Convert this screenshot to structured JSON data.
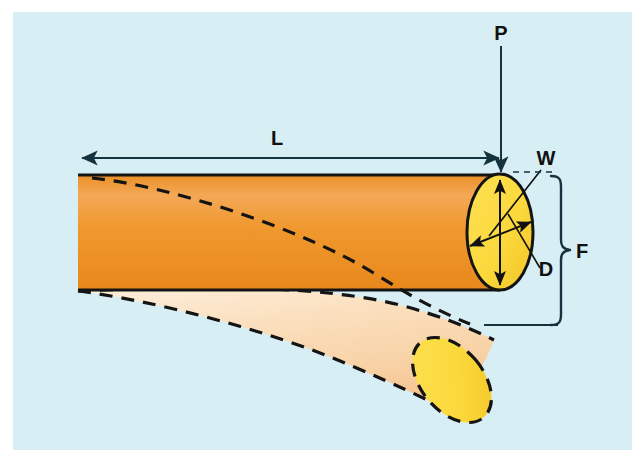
{
  "figure": {
    "background_color": "#d7eef4",
    "page_color": "#ffffff"
  },
  "colors": {
    "background": "#d7eef4",
    "beam_orange_light": "#f4a857",
    "beam_orange": "#f0982e",
    "beam_orange_dark": "#e98c22",
    "end_face_yellow": "#fbd93d",
    "end_face_yellow_dark": "#f5c72a",
    "deflected_beam_light": "#fbe4c8",
    "deflected_beam": "#f8d5ac",
    "deflected_beam_dark": "#f6c894",
    "outline": "#1a1a1a",
    "dimension_line": "#15333f"
  },
  "labels": {
    "load": {
      "text": "P",
      "meaning": "applied point load at free end",
      "x": 501,
      "y": 40
    },
    "length": {
      "text": "L",
      "meaning": "beam length",
      "x": 277,
      "y": 145
    },
    "width": {
      "text": "W",
      "meaning": "cross-section width",
      "x": 546,
      "y": 165
    },
    "depth": {
      "text": "D",
      "meaning": "cross-section depth",
      "x": 546,
      "y": 276
    },
    "deflection": {
      "text": "F",
      "meaning": "deflection at free end",
      "x": 582,
      "y": 258
    }
  },
  "annotations": {
    "load_arrow": {
      "name": "load-arrow-P",
      "from_x": 501,
      "from_y": 44,
      "to_x": 501,
      "to_y": 176,
      "direction": "down"
    },
    "length_dimension": {
      "name": "length-dimension-L",
      "from_x": 80,
      "from_y": 158,
      "to_x": 501,
      "to_y": 158,
      "arrowheads": "both"
    },
    "depth_arrow": {
      "name": "depth-dimension-D",
      "from_x": 500,
      "from_y": 176,
      "to_x": 500,
      "to_y": 289,
      "arrowheads": "both"
    },
    "width_arrow": {
      "name": "width-dimension-W",
      "from_x": 468,
      "from_y": 245,
      "to_x": 532,
      "to_y": 222,
      "arrowheads": "both"
    },
    "deflection_bracket": {
      "name": "deflection-bracket-F",
      "top_y": 178,
      "bottom_y": 325,
      "x": 561
    }
  },
  "geometry": {
    "beam_left_x": 78,
    "beam_top_y": 174,
    "beam_bottom_y": 290,
    "beam_right_x": 500,
    "end_face_center_x": 500,
    "end_face_center_y": 232,
    "end_face_rx": 33,
    "end_face_ry": 58,
    "deflected_tip_center_x": 452,
    "deflected_tip_center_y": 380,
    "deflected_tip_rx": 31,
    "deflected_tip_ry": 49,
    "deflected_tip_rotation_deg": -40
  }
}
